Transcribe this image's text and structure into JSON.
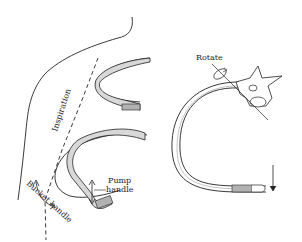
{
  "figure": {
    "labels": {
      "inspiration": "Inspiration",
      "bucket_handle": "Bucket handle",
      "pump_handle": "Pump",
      "pump_handle_line2": "handle",
      "rotate": "Rotate"
    },
    "colors": {
      "line": "#222222",
      "rib_fill": "#d8d8d8",
      "background": "#ffffff"
    }
  }
}
